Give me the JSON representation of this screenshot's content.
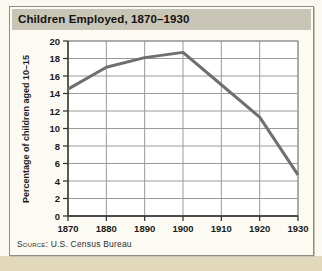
{
  "title": "Children Employed, 1870–1930",
  "source": {
    "label": "Source:",
    "text": "U.S. Census Bureau"
  },
  "chart_data": {
    "type": "line",
    "title": "Children Employed, 1870–1930",
    "categories": [
      "1870",
      "1880",
      "1890",
      "1900",
      "1910",
      "1920",
      "1930"
    ],
    "values": [
      14.5,
      17,
      18.1,
      18.7,
      15,
      11.3,
      4.7
    ],
    "xlabel": "",
    "ylabel": "Percentage of children aged 10–15",
    "ylim": [
      0,
      20
    ],
    "ytick_interval": 2,
    "grid": true,
    "legend": false,
    "line_color": "#6f6f6f",
    "gridline_color": "#9a9a98",
    "axis_color": "#2b2b2b"
  },
  "colors": {
    "title_bar_bg": "#c8c5b6",
    "card_bg": "#fcfbf3",
    "page_bg": "#f9f8f1",
    "bottom_strip": "#e2d9ba"
  }
}
